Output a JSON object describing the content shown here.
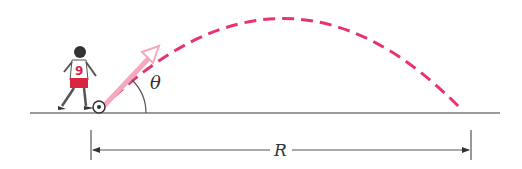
{
  "diagram": {
    "labels": {
      "angle": "θ",
      "range": "R"
    },
    "colors": {
      "trajectory": "#e8336b",
      "velocity_arrow": "#f4a9be",
      "ground": "#7a7a7a",
      "dimension": "#555555",
      "player": "#d9263f"
    },
    "player_number": "9"
  }
}
